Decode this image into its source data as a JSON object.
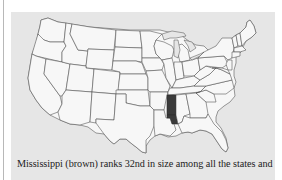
{
  "figure": {
    "highlighted_state": "Mississippi",
    "colors": {
      "panel_background": "#e6e6e6",
      "state_fill": "#f7f7f7",
      "state_border": "#4a4a4a",
      "highlight_fill": "#3a3a3a"
    }
  },
  "caption": {
    "text": "Mississippi (brown) ranks 32nd in size among all the states and"
  }
}
